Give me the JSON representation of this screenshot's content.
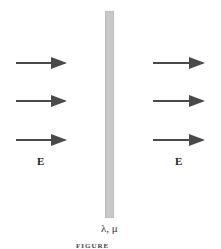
{
  "diagram": {
    "slab": {
      "label": "λ, μ",
      "color": "#c9c9c9"
    },
    "incident_field_label": "E",
    "transmitted_field_label": "E",
    "arrow_color": "#4a4a4a",
    "arrows_per_side": 3,
    "caption": "FIGURE"
  }
}
